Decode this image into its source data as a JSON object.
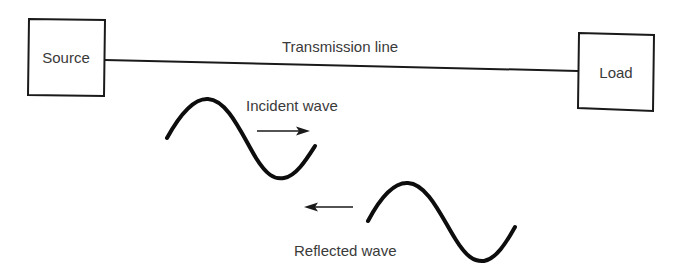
{
  "diagram": {
    "type": "transmission-line-reflection",
    "colors": {
      "stroke": "#1a1a1a",
      "text": "#3a3a3a",
      "background": "#ffffff"
    },
    "nodes": {
      "source": {
        "label": "Source"
      },
      "load": {
        "label": "Load"
      }
    },
    "edges": {
      "transmission_line": {
        "label": "Transmission line",
        "from": "source",
        "to": "load"
      }
    },
    "waves": {
      "incident": {
        "label": "Incident wave",
        "direction": "right"
      },
      "reflected": {
        "label": "Reflected wave",
        "direction": "left"
      }
    }
  }
}
